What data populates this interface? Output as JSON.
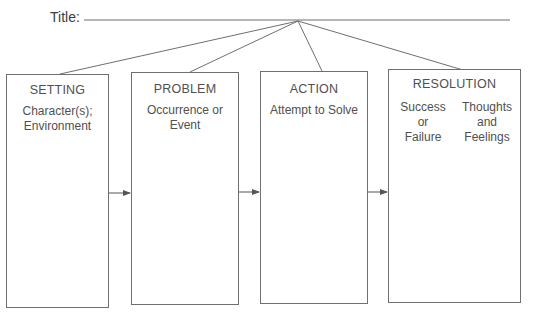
{
  "title": {
    "label": "Title:"
  },
  "boxes": [
    {
      "heading": "SETTING",
      "sub": [
        "Character(s);",
        "Environment"
      ]
    },
    {
      "heading": "PROBLEM",
      "sub": [
        "Occurrence or",
        "Event"
      ]
    },
    {
      "heading": "ACTION",
      "sub": [
        "Attempt to Solve"
      ]
    },
    {
      "heading": "RESOLUTION",
      "columns": [
        [
          "Success",
          "or",
          "Failure"
        ],
        [
          "Thoughts",
          "and",
          "Feelings"
        ]
      ]
    }
  ],
  "colors": {
    "line": "#6f6f6f",
    "text": "#505050"
  }
}
